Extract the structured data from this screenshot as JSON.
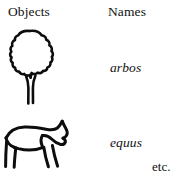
{
  "figure": {
    "background_color": "#ffffff",
    "ink_color": "#0d0d0d",
    "columns": {
      "objects_header": "Objects",
      "names_header": "Names"
    },
    "rows": [
      {
        "object_icon": "tree-sketch",
        "object_description": "hand-drawn outline of a tree with bushy canopy and forked trunk",
        "name": "arbos"
      },
      {
        "object_icon": "horse-sketch",
        "object_description": "hand-drawn outline of a horse in profile facing right",
        "name": "equus"
      }
    ],
    "continuation_label": "etc."
  }
}
